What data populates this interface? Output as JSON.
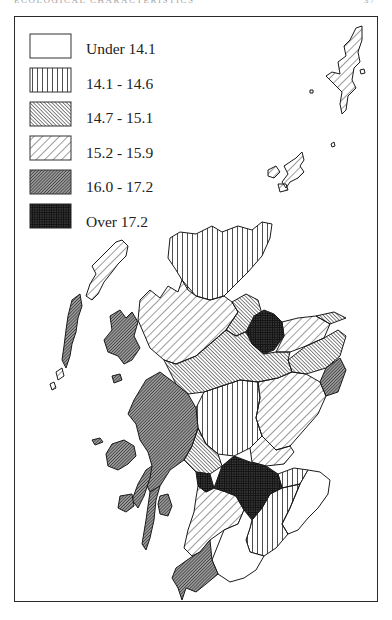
{
  "page": {
    "running_head": "ECOLOGICAL CHARACTERISTICS",
    "page_number": "37"
  },
  "map": {
    "subject": "Scotland choropleth map",
    "legend": {
      "items": [
        {
          "label": "Under 14.1",
          "pattern": "blank",
          "icon": "blank-swatch"
        },
        {
          "label": "14.1 - 14.6",
          "pattern": "vertical-lines",
          "icon": "vertical-hatch-swatch"
        },
        {
          "label": "14.7 - 15.1",
          "pattern": "dense-diagonal-lines",
          "icon": "dense-diagonal-hatch-swatch"
        },
        {
          "label": "15.2 - 15.9",
          "pattern": "wide-diagonal-lines",
          "icon": "wide-diagonal-hatch-swatch"
        },
        {
          "label": "16.0 - 17.2",
          "pattern": "dark-diagonal-lines",
          "icon": "dark-diagonal-hatch-swatch"
        },
        {
          "label": "Over 17.2",
          "pattern": "cross-hatch-solid",
          "icon": "crosshatch-swatch"
        }
      ]
    },
    "colors": {
      "ink": "#1a1a1a",
      "paper": "#ffffff"
    }
  }
}
